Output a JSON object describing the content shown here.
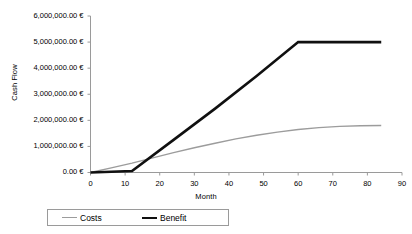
{
  "chart_data": {
    "type": "line",
    "title": "",
    "xlabel": "Month",
    "ylabel": "Cash Flow",
    "xlim": [
      0,
      90
    ],
    "ylim": [
      0,
      6000000
    ],
    "grid": false,
    "legend_position": "bottom",
    "x_ticks": [
      "0",
      "10",
      "20",
      "30",
      "40",
      "50",
      "60",
      "70",
      "80",
      "90"
    ],
    "x_tick_values": [
      0,
      10,
      20,
      30,
      40,
      50,
      60,
      70,
      80,
      90
    ],
    "y_ticks": [
      "0.00 €",
      "1,000,000.00 €",
      "2,000,000.00 €",
      "3,000,000.00 €",
      "4,000,000.00 €",
      "5,000,000.00 €",
      "6,000,000.00 €"
    ],
    "y_tick_values": [
      0,
      1000000,
      2000000,
      3000000,
      4000000,
      5000000,
      6000000
    ],
    "series": [
      {
        "name": "Costs",
        "color": "#9c9c9c",
        "width": 1.4,
        "x": [
          0,
          6,
          12,
          18,
          24,
          30,
          36,
          42,
          48,
          54,
          60,
          66,
          72,
          78,
          84
        ],
        "values": [
          0,
          180000,
          360000,
          560000,
          760000,
          950000,
          1120000,
          1290000,
          1430000,
          1550000,
          1650000,
          1720000,
          1770000,
          1790000,
          1800000
        ]
      },
      {
        "name": "Benefit",
        "color": "#101010",
        "width": 2.6,
        "x": [
          0,
          6,
          12,
          24,
          36,
          48,
          60,
          72,
          84
        ],
        "values": [
          0,
          30000,
          60000,
          1250000,
          2450000,
          3700000,
          5000000,
          5000000,
          5000000
        ]
      }
    ]
  },
  "legend": {
    "items": [
      {
        "label": "Costs"
      },
      {
        "label": "Benefit"
      }
    ]
  }
}
